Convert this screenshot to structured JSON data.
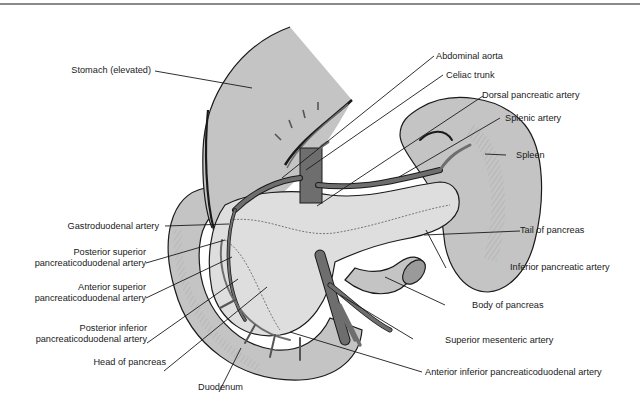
{
  "figure": {
    "colors": {
      "organ_fill": "#c4c4c4",
      "pancreas_fill": "#dedede",
      "artery_fill": "#6e6e6e",
      "outline": "#1a1a1a",
      "background": "#ffffff"
    }
  },
  "labels": {
    "stomach": "Stomach (elevated)",
    "abdominal_aorta": "Abdominal aorta",
    "celiac_trunk": "Celiac trunk",
    "dorsal_pancreatic_artery": "Dorsal pancreatic artery",
    "splenic_artery": "Splenic artery",
    "spleen": "Spleen",
    "gastroduodenal_artery": "Gastroduodenal artery",
    "posterior_superior_1": "Posterior superior",
    "posterior_superior_2": "pancreaticoduodenal artery",
    "anterior_superior_1": "Anterior superior",
    "anterior_superior_2": "pancreaticoduodenal artery",
    "tail_of_pancreas": "Tail of pancreas",
    "inferior_pancreatic_artery": "Inferior pancreatic artery",
    "body_of_pancreas": "Body of pancreas",
    "posterior_inferior_1": "Posterior inferior",
    "posterior_inferior_2": "pancreaticoduodenal artery",
    "superior_mesenteric_artery": "Superior mesenteric artery",
    "head_of_pancreas": "Head of pancreas",
    "anterior_inferior": "Anterior inferior pancreaticoduodenal artery",
    "duodenum": "Duodenum"
  }
}
